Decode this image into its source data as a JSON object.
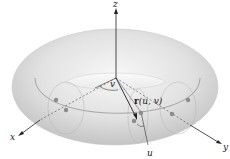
{
  "figure": {
    "type": "torus-parametrization",
    "labels": {
      "z_axis": "z",
      "x_axis": "x",
      "y_axis": "y",
      "angle_v": "v",
      "angle_u": "u",
      "vector_r_bold": "r",
      "vector_r_args": "(u, v)"
    },
    "colors": {
      "torus_light": "#efefef",
      "torus_mid": "#d6d6d6",
      "torus_dark": "#bdbdbd",
      "axis": "#222222",
      "point": "#8c8c8c",
      "curve": "#7a7a7a"
    }
  }
}
